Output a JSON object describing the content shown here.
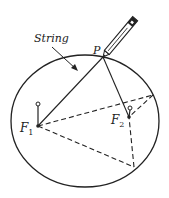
{
  "diagram": {
    "labels": {
      "string": "String",
      "point": "P",
      "focus1": "F",
      "focus1_sub": "1",
      "focus2": "F",
      "focus2_sub": "2"
    },
    "colors": {
      "stroke": "#222222",
      "background": "#ffffff"
    },
    "points": {
      "P": [
        103,
        57
      ],
      "F1": [
        38,
        126
      ],
      "F2": [
        129,
        117
      ],
      "right_point": [
        153,
        95
      ],
      "bottom_point": [
        134,
        167
      ]
    },
    "ellipse": {
      "cx": 85,
      "cy": 121,
      "rx": 74,
      "ry": 66
    }
  }
}
